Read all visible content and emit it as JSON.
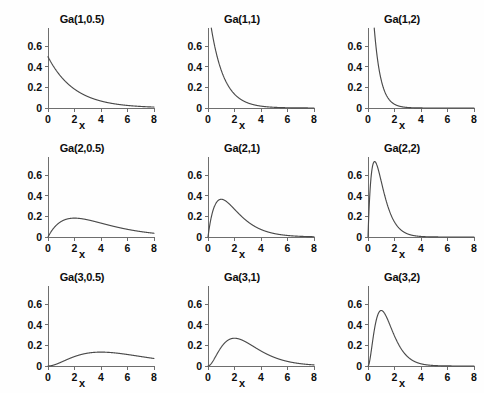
{
  "figure": {
    "background_color": "#ffffff",
    "curve_color": "#4a4a4a",
    "axis_color": "#6e6e6e",
    "text_color": "#0d0d0d",
    "rows": 3,
    "columns": 3
  },
  "chart_data": [
    {
      "type": "line",
      "title": "Ga(1,0.5)",
      "xlabel": "x",
      "ylabel": "",
      "distribution": "gamma",
      "shape": 1,
      "rate": 0.5,
      "xlim": [
        0,
        8
      ],
      "ylim": [
        0,
        0.78
      ],
      "xticks": [
        0,
        2,
        4,
        6,
        8
      ],
      "yticks": [
        0,
        0.2,
        0.4,
        0.6
      ],
      "ytick_labels": [
        "0",
        "0.2",
        "0.4",
        "0.6"
      ],
      "grid": false,
      "legend": "none",
      "x": [
        0,
        0.5,
        1,
        1.5,
        2,
        2.5,
        3,
        3.5,
        4,
        4.5,
        5,
        5.5,
        6,
        6.5,
        7,
        7.5,
        8
      ],
      "y": [
        0.5,
        0.389,
        0.303,
        0.236,
        0.184,
        0.143,
        0.112,
        0.087,
        0.068,
        0.053,
        0.041,
        0.032,
        0.025,
        0.019,
        0.015,
        0.012,
        0.009
      ]
    },
    {
      "type": "line",
      "title": "Ga(1,1)",
      "xlabel": "x",
      "ylabel": "",
      "distribution": "gamma",
      "shape": 1,
      "rate": 1,
      "xlim": [
        0,
        8
      ],
      "ylim": [
        0,
        0.78
      ],
      "xticks": [
        0,
        2,
        4,
        6,
        8
      ],
      "yticks": [
        0,
        0.2,
        0.4,
        0.6
      ],
      "ytick_labels": [
        "0",
        "0.2",
        "0.4",
        "0.6"
      ],
      "grid": false,
      "legend": "none",
      "x": [
        0,
        0.5,
        1,
        1.5,
        2,
        2.5,
        3,
        3.5,
        4,
        4.5,
        5,
        5.5,
        6,
        6.5,
        7,
        7.5,
        8
      ],
      "y": [
        1.0,
        0.607,
        0.368,
        0.223,
        0.135,
        0.082,
        0.05,
        0.03,
        0.018,
        0.011,
        0.007,
        0.004,
        0.002,
        0.0015,
        0.0009,
        0.0006,
        0.0003
      ]
    },
    {
      "type": "line",
      "title": "Ga(1,2)",
      "xlabel": "x",
      "ylabel": "",
      "distribution": "gamma",
      "shape": 1,
      "rate": 2,
      "xlim": [
        0,
        8
      ],
      "ylim": [
        0,
        0.78
      ],
      "xticks": [
        0,
        2,
        4,
        6,
        8
      ],
      "yticks": [
        0,
        0.2,
        0.4,
        0.6
      ],
      "ytick_labels": [
        "0",
        "0.2",
        "0.4",
        "0.6"
      ],
      "grid": false,
      "legend": "none",
      "x": [
        0,
        0.5,
        1,
        1.5,
        2,
        2.5,
        3,
        3.5,
        4,
        4.5,
        5,
        5.5,
        6,
        6.5,
        7,
        7.5,
        8
      ],
      "y": [
        2.0,
        0.736,
        0.271,
        0.1,
        0.037,
        0.013,
        0.005,
        0.002,
        0.0007,
        0.0002,
        0.0001,
        0,
        0,
        0,
        0,
        0,
        0
      ]
    },
    {
      "type": "line",
      "title": "Ga(2,0.5)",
      "xlabel": "x",
      "ylabel": "",
      "distribution": "gamma",
      "shape": 2,
      "rate": 0.5,
      "xlim": [
        0,
        8
      ],
      "ylim": [
        0,
        0.78
      ],
      "xticks": [
        0,
        2,
        4,
        6,
        8
      ],
      "yticks": [
        0,
        0.2,
        0.4,
        0.6
      ],
      "ytick_labels": [
        "0",
        "0.2",
        "0.4",
        "0.6"
      ],
      "grid": false,
      "legend": "none",
      "x": [
        0,
        0.5,
        1,
        1.5,
        2,
        2.5,
        3,
        3.5,
        4,
        4.5,
        5,
        5.5,
        6,
        6.5,
        7,
        7.5,
        8
      ],
      "y": [
        0,
        0.097,
        0.152,
        0.177,
        0.184,
        0.179,
        0.167,
        0.153,
        0.135,
        0.119,
        0.103,
        0.088,
        0.075,
        0.063,
        0.053,
        0.044,
        0.037
      ]
    },
    {
      "type": "line",
      "title": "Ga(2,1)",
      "xlabel": "x",
      "ylabel": "",
      "distribution": "gamma",
      "shape": 2,
      "rate": 1,
      "xlim": [
        0,
        8
      ],
      "ylim": [
        0,
        0.78
      ],
      "xticks": [
        0,
        2,
        4,
        6,
        8
      ],
      "yticks": [
        0,
        0.2,
        0.4,
        0.6
      ],
      "ytick_labels": [
        "0",
        "0.2",
        "0.4",
        "0.6"
      ],
      "grid": false,
      "legend": "none",
      "x": [
        0,
        0.5,
        1,
        1.5,
        2,
        2.5,
        3,
        3.5,
        4,
        4.5,
        5,
        5.5,
        6,
        6.5,
        7,
        7.5,
        8
      ],
      "y": [
        0,
        0.303,
        0.368,
        0.335,
        0.271,
        0.205,
        0.149,
        0.106,
        0.073,
        0.05,
        0.034,
        0.022,
        0.015,
        0.01,
        0.006,
        0.004,
        0.003
      ]
    },
    {
      "type": "line",
      "title": "Ga(2,2)",
      "xlabel": "x",
      "ylabel": "",
      "distribution": "gamma",
      "shape": 2,
      "rate": 2,
      "xlim": [
        0,
        8
      ],
      "ylim": [
        0,
        0.78
      ],
      "xticks": [
        0,
        2,
        4,
        6,
        8
      ],
      "yticks": [
        0,
        0.2,
        0.4,
        0.6
      ],
      "ytick_labels": [
        "0",
        "0.2",
        "0.4",
        "0.6"
      ],
      "grid": false,
      "legend": "none",
      "x": [
        0,
        0.5,
        1,
        1.5,
        2,
        2.5,
        3,
        3.5,
        4,
        4.5,
        5,
        5.5,
        6,
        6.5,
        7,
        7.5,
        8
      ],
      "y": [
        0,
        0.736,
        0.541,
        0.299,
        0.147,
        0.067,
        0.03,
        0.013,
        0.005,
        0.002,
        0.0009,
        0.0004,
        0.0001,
        0,
        0,
        0,
        0
      ]
    },
    {
      "type": "line",
      "title": "Ga(3,0.5)",
      "xlabel": "x",
      "ylabel": "",
      "distribution": "gamma",
      "shape": 3,
      "rate": 0.5,
      "xlim": [
        0,
        8
      ],
      "ylim": [
        0,
        0.78
      ],
      "xticks": [
        0,
        2,
        4,
        6,
        8
      ],
      "yticks": [
        0,
        0.2,
        0.4,
        0.6
      ],
      "ytick_labels": [
        "0",
        "0.2",
        "0.4",
        "0.6"
      ],
      "grid": false,
      "legend": "none",
      "x": [
        0,
        0.5,
        1,
        1.5,
        2,
        2.5,
        3,
        3.5,
        4,
        4.5,
        5,
        5.5,
        6,
        6.5,
        7,
        7.5,
        8
      ],
      "y": [
        0,
        0.012,
        0.038,
        0.066,
        0.092,
        0.112,
        0.126,
        0.134,
        0.135,
        0.134,
        0.128,
        0.121,
        0.112,
        0.102,
        0.092,
        0.082,
        0.073
      ]
    },
    {
      "type": "line",
      "title": "Ga(3,1)",
      "xlabel": "x",
      "ylabel": "",
      "distribution": "gamma",
      "shape": 3,
      "rate": 1,
      "xlim": [
        0,
        8
      ],
      "ylim": [
        0,
        0.78
      ],
      "xticks": [
        0,
        2,
        4,
        6,
        8
      ],
      "yticks": [
        0,
        0.2,
        0.4,
        0.6
      ],
      "ytick_labels": [
        "0",
        "0.2",
        "0.4",
        "0.6"
      ],
      "grid": false,
      "legend": "none",
      "x": [
        0,
        0.5,
        1,
        1.5,
        2,
        2.5,
        3,
        3.5,
        4,
        4.5,
        5,
        5.5,
        6,
        6.5,
        7,
        7.5,
        8
      ],
      "y": [
        0,
        0.076,
        0.184,
        0.251,
        0.271,
        0.257,
        0.224,
        0.185,
        0.147,
        0.113,
        0.084,
        0.062,
        0.045,
        0.032,
        0.022,
        0.016,
        0.011
      ]
    },
    {
      "type": "line",
      "title": "Ga(3,2)",
      "xlabel": "x",
      "ylabel": "",
      "distribution": "gamma",
      "shape": 3,
      "rate": 2,
      "xlim": [
        0,
        8
      ],
      "ylim": [
        0,
        0.78
      ],
      "xticks": [
        0,
        2,
        4,
        6,
        8
      ],
      "yticks": [
        0,
        0.2,
        0.4,
        0.6
      ],
      "ytick_labels": [
        "0",
        "0.2",
        "0.4",
        "0.6"
      ],
      "grid": false,
      "legend": "none",
      "x": [
        0,
        0.5,
        1,
        1.5,
        2,
        2.5,
        3,
        3.5,
        4,
        4.5,
        5,
        5.5,
        6,
        6.5,
        7,
        7.5,
        8
      ],
      "y": [
        0,
        0.368,
        0.541,
        0.448,
        0.293,
        0.168,
        0.089,
        0.045,
        0.022,
        0.01,
        0.005,
        0.002,
        0.001,
        0.0004,
        0.0002,
        0.0001,
        0
      ]
    }
  ]
}
